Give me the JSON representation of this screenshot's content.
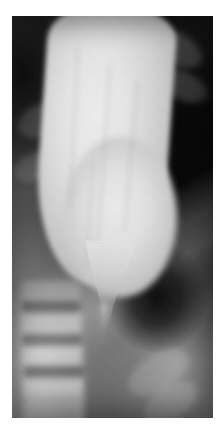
{
  "image": {
    "modality": "radiograph",
    "study": "barium esophagram",
    "view": "frontal",
    "caption": "",
    "alt_text": "Barium esophagram radiograph showing a markedly dilated esophagus with a smooth tapered bird-beak narrowing at the gastroesophageal junction",
    "plate": {
      "left": 12,
      "top": 16,
      "width": 201,
      "height": 402
    },
    "page_background": "#ffffff",
    "palette": {
      "page_margin": "#ffffff",
      "lung_field_dark": "#101010",
      "soft_tissue_mid": "#5e5e5e",
      "abdomen_gray": "#6b6b6b",
      "barium_bright": "#f0f0f0",
      "barium_edge": "#c2c2c2",
      "bone_highlight": "#bebebe",
      "gas_pocket": "#000000"
    }
  },
  "regions": [
    {
      "name": "dilated-esophagus",
      "label": "Dilated barium-filled esophagus"
    },
    {
      "name": "bird-beak-taper",
      "label": "Smooth tapered narrowing at gastroesophageal junction"
    },
    {
      "name": "left-lung-field",
      "label": "Left lung field"
    },
    {
      "name": "right-lung-field",
      "label": "Right lung field"
    },
    {
      "name": "thoracic-spine",
      "label": "Thoracic vertebral bodies"
    },
    {
      "name": "diaphragm-band",
      "label": "Diaphragmatic soft tissue band"
    },
    {
      "name": "gastric-gas-pocket",
      "label": "Gastric gas pocket"
    }
  ],
  "vertebrae": [
    {
      "x": 4,
      "y": 66,
      "w": 30,
      "h": 21
    },
    {
      "x": 4,
      "y": 73,
      "w": 31,
      "h": 21
    },
    {
      "x": 5,
      "y": 81,
      "w": 31,
      "h": 21
    },
    {
      "x": 6,
      "y": 89,
      "w": 30,
      "h": 20
    }
  ],
  "discs": [
    {
      "x": 5,
      "y": 71,
      "w": 29,
      "h": 3
    },
    {
      "x": 5,
      "y": 79,
      "w": 30,
      "h": 3
    },
    {
      "x": 6,
      "y": 87,
      "w": 30,
      "h": 3
    }
  ],
  "ribs": [
    {
      "x": 2,
      "y": 22,
      "w": 26,
      "h": 8,
      "rot": -24
    },
    {
      "x": 0,
      "y": 34,
      "w": 24,
      "h": 7,
      "rot": -20
    },
    {
      "x": 66,
      "y": 4,
      "w": 30,
      "h": 8,
      "rot": 28
    },
    {
      "x": 72,
      "y": 14,
      "w": 26,
      "h": 7,
      "rot": 24
    },
    {
      "x": 56,
      "y": 84,
      "w": 34,
      "h": 9,
      "rot": -32
    },
    {
      "x": 64,
      "y": 92,
      "w": 30,
      "h": 8,
      "rot": -30
    }
  ],
  "striations": [
    {
      "x": 30,
      "y": 8,
      "w": 2,
      "h": 40,
      "rot": 3
    },
    {
      "x": 45,
      "y": 12,
      "w": 2,
      "h": 44,
      "rot": 4
    },
    {
      "x": 58,
      "y": 16,
      "w": 2,
      "h": 38,
      "rot": 5
    },
    {
      "x": 38,
      "y": 36,
      "w": 2,
      "h": 26,
      "rot": 4
    }
  ]
}
